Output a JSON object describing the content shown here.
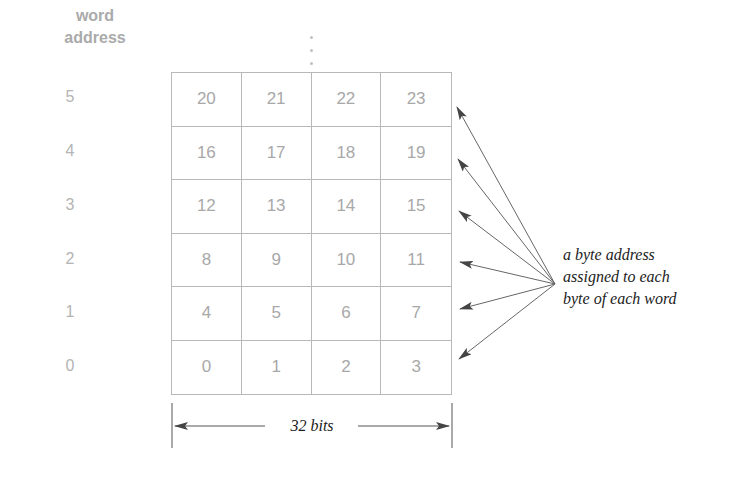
{
  "header": {
    "line1": "word",
    "line2": "address"
  },
  "word_addresses": [
    "5",
    "4",
    "3",
    "2",
    "1",
    "0"
  ],
  "grid_rows": [
    [
      "20",
      "21",
      "22",
      "23"
    ],
    [
      "16",
      "17",
      "18",
      "19"
    ],
    [
      "12",
      "13",
      "14",
      "15"
    ],
    [
      "8",
      "9",
      "10",
      "11"
    ],
    [
      "4",
      "5",
      "6",
      "7"
    ],
    [
      "0",
      "1",
      "2",
      "3"
    ]
  ],
  "continuation": "⋮",
  "caption": {
    "line1": "a byte address",
    "line2": "assigned to each",
    "line3": "byte of each word"
  },
  "width_label": "32 bits",
  "colors": {
    "grid": "#b8b8b8",
    "numbers": "#a8a8a8",
    "arrows": "#555555",
    "text": "#222222"
  }
}
